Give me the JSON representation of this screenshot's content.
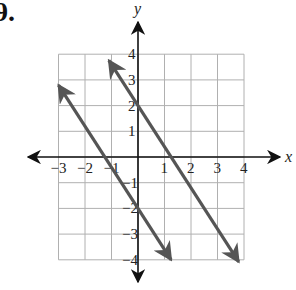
{
  "problem": {
    "label": "9."
  },
  "chart_data": {
    "type": "line",
    "title": "",
    "xlabel": "x",
    "ylabel": "y",
    "xlim": [
      -3,
      4
    ],
    "ylim": [
      -4,
      4
    ],
    "grid": true,
    "x_ticks": [
      "-3",
      "-2",
      "-1",
      "1",
      "2",
      "3",
      "4"
    ],
    "y_ticks": [
      "4",
      "3",
      "2",
      "1",
      "-1",
      "-2",
      "-3",
      "-4"
    ],
    "series": [
      {
        "name": "line-1",
        "equation": "y = -1.6x + 2",
        "slope": -1.6,
        "y_intercept": 2,
        "x": [
          -1.1,
          3.8
        ],
        "y": [
          3.76,
          -4.08
        ],
        "color": "#555555"
      },
      {
        "name": "line-2",
        "equation": "y = -1.6x - 2",
        "slope": -1.6,
        "y_intercept": -2,
        "x": [
          -3.0,
          1.25
        ],
        "y": [
          2.8,
          -4.0
        ],
        "color": "#555555"
      }
    ]
  },
  "colors": {
    "grid": "#b0b0b0",
    "axis": "#111111",
    "line": "#555555"
  }
}
